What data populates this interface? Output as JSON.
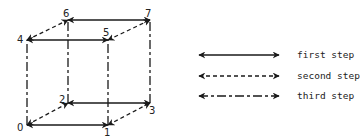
{
  "vertices": [
    {
      "id": "0",
      "x": 27,
      "y": 125,
      "lx": 17,
      "ly": 131
    },
    {
      "id": "1",
      "x": 108,
      "y": 125,
      "lx": 104,
      "ly": 136
    },
    {
      "id": "2",
      "x": 68,
      "y": 103,
      "lx": 59,
      "ly": 103
    },
    {
      "id": "3",
      "x": 150,
      "y": 103,
      "lx": 149,
      "ly": 114
    },
    {
      "id": "4",
      "x": 27,
      "y": 40,
      "lx": 17,
      "ly": 43
    },
    {
      "id": "5",
      "x": 108,
      "y": 40,
      "lx": 103,
      "ly": 36
    },
    {
      "id": "6",
      "x": 68,
      "y": 20,
      "lx": 63,
      "ly": 17
    },
    {
      "id": "7",
      "x": 150,
      "y": 20,
      "lx": 145,
      "ly": 17
    }
  ],
  "edges": [
    {
      "from": "0",
      "to": "1",
      "step": "first"
    },
    {
      "from": "2",
      "to": "3",
      "step": "first"
    },
    {
      "from": "4",
      "to": "5",
      "step": "first"
    },
    {
      "from": "6",
      "to": "7",
      "step": "first"
    },
    {
      "from": "0",
      "to": "2",
      "step": "second"
    },
    {
      "from": "1",
      "to": "3",
      "step": "second"
    },
    {
      "from": "4",
      "to": "6",
      "step": "second"
    },
    {
      "from": "5",
      "to": "7",
      "step": "second"
    },
    {
      "from": "0",
      "to": "4",
      "step": "third"
    },
    {
      "from": "1",
      "to": "5",
      "step": "third"
    },
    {
      "from": "2",
      "to": "6",
      "step": "third"
    },
    {
      "from": "3",
      "to": "7",
      "step": "third"
    }
  ],
  "legend": [
    {
      "step": "first",
      "label": "first step",
      "y": 55
    },
    {
      "step": "second",
      "label": "second step",
      "y": 76
    },
    {
      "step": "third",
      "label": "third step",
      "y": 96
    }
  ],
  "colors": {
    "line": "#1a1a1a",
    "background": "#ffffff"
  }
}
